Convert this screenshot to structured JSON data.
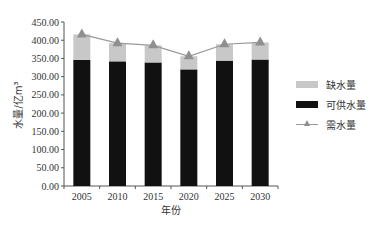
{
  "chart_data": {
    "type": "bar",
    "subtype": "stacked bar with line",
    "title": "",
    "xlabel": "年份",
    "ylabel": "水量/亿m³",
    "categories": [
      "2005",
      "2010",
      "2015",
      "2020",
      "2025",
      "2030"
    ],
    "series": [
      {
        "name": "可供水量",
        "type": "bar",
        "stack": "total",
        "color": "#111111",
        "values": [
          346,
          342,
          339,
          320,
          344,
          347
        ]
      },
      {
        "name": "缺水量",
        "type": "bar",
        "stack": "total",
        "color": "#c8c8c8",
        "values": [
          70,
          50,
          47,
          36,
          45,
          47
        ]
      },
      {
        "name": "需水量",
        "type": "line",
        "marker": "triangle",
        "color": "#8f8f8f",
        "values": [
          416,
          392,
          386,
          356,
          389,
          394
        ]
      }
    ],
    "yticks": [
      "0.00",
      "50.00",
      "100.00",
      "150.00",
      "200.00",
      "250.00",
      "300.00",
      "350.00",
      "400.00",
      "450.00"
    ],
    "ylim": [
      0,
      450
    ],
    "grid": false,
    "legend_position": "right"
  },
  "legend": {
    "items": [
      {
        "label": "缺水量",
        "color": "#c8c8c8",
        "kind": "bar"
      },
      {
        "label": "可供水量",
        "color": "#111111",
        "kind": "bar"
      },
      {
        "label": "需水量",
        "color": "#8f8f8f",
        "kind": "line-triangle"
      }
    ]
  }
}
